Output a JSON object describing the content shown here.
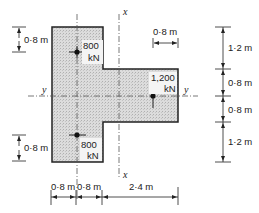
{
  "diagram": {
    "axes": {
      "x_label": "x",
      "y_label": "y"
    },
    "loads": [
      {
        "value_label": "800",
        "unit_label": "kN",
        "position": "upper-left column"
      },
      {
        "value_label": "1,200",
        "unit_label": "kN",
        "position": "right arm"
      },
      {
        "value_label": "800",
        "unit_label": "kN",
        "position": "lower-left column"
      }
    ],
    "dimensions": {
      "left_top": "0·8 m",
      "left_bottom": "0·8 m",
      "top_right_arm": "0·8 m",
      "right": [
        "1·2 m",
        "0·8 m",
        "0·8 m",
        "1·2 m"
      ],
      "bottom": [
        "0·8 m",
        "0·8 m",
        "2·4 m"
      ]
    },
    "colors": {
      "fill": "#d4d4d4",
      "outline": "#222222"
    }
  }
}
